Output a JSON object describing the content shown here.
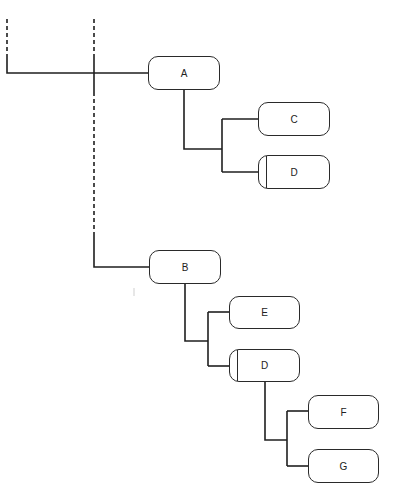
{
  "diagram": {
    "type": "tree",
    "colors": {
      "stroke": "#1f1f1f",
      "node_border": "#2a2a2a",
      "background": "#ffffff"
    },
    "nodes": [
      {
        "id": "A",
        "label": "A",
        "x": 148,
        "y": 56,
        "w": 72,
        "h": 34,
        "variant": "plain"
      },
      {
        "id": "C",
        "label": "C",
        "x": 258,
        "y": 102,
        "w": 72,
        "h": 34,
        "variant": "plain"
      },
      {
        "id": "D1",
        "label": "D",
        "x": 258,
        "y": 155,
        "w": 72,
        "h": 34,
        "variant": "barred"
      },
      {
        "id": "B",
        "label": "B",
        "x": 149,
        "y": 250,
        "w": 72,
        "h": 34,
        "variant": "plain"
      },
      {
        "id": "E",
        "label": "E",
        "x": 229,
        "y": 296,
        "w": 71,
        "h": 33,
        "variant": "plain"
      },
      {
        "id": "D2",
        "label": "D",
        "x": 229,
        "y": 349,
        "w": 71,
        "h": 33,
        "variant": "barred"
      },
      {
        "id": "F",
        "label": "F",
        "x": 308,
        "y": 395,
        "w": 71,
        "h": 34,
        "variant": "plain"
      },
      {
        "id": "G",
        "label": "G",
        "x": 308,
        "y": 449,
        "w": 71,
        "h": 34,
        "variant": "plain"
      }
    ],
    "edges": [
      {
        "from": "root-left",
        "to": "A"
      },
      {
        "from": "root-mid",
        "to": "A"
      },
      {
        "from": "root-mid",
        "to": "B"
      },
      {
        "from": "A",
        "to": "C"
      },
      {
        "from": "A",
        "to": "D1"
      },
      {
        "from": "B",
        "to": "E"
      },
      {
        "from": "B",
        "to": "D2"
      },
      {
        "from": "D2",
        "to": "F"
      },
      {
        "from": "D2",
        "to": "G"
      }
    ]
  }
}
